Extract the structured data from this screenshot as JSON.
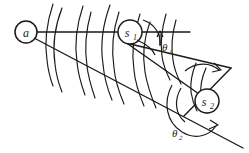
{
  "figure": {
    "type": "hand-drawn-scientific-diagram",
    "background_color": "#ffffff",
    "ink_color": "#1a1a1a",
    "width": 249,
    "height": 153
  },
  "nodes": [
    {
      "id": "a",
      "label": "a",
      "cx": 26,
      "cy": 32,
      "r": 11
    },
    {
      "id": "s1",
      "label": "s",
      "sub": "1",
      "cx": 130,
      "cy": 32,
      "r": 12
    },
    {
      "id": "s2",
      "label": "s",
      "sub": "2",
      "cx": 207,
      "cy": 101,
      "r": 12
    }
  ],
  "angles": [
    {
      "id": "theta1",
      "label": "θ",
      "sub": "1",
      "x": 161,
      "y": 47,
      "at_node": "s1"
    },
    {
      "id": "theta2",
      "label": "θ",
      "sub": "2",
      "x": 175,
      "y": 133,
      "at_node": "s2"
    }
  ],
  "rays": [
    {
      "id": "ray-a-s1",
      "from": "a",
      "to": "s1",
      "note": "horizontal reference ray"
    },
    {
      "id": "ray-a-s2",
      "from": "a",
      "to": "s2",
      "note": "oblique scattering ray"
    },
    {
      "id": "ray-s1-s2",
      "from": "s1",
      "to": "s2",
      "note": "secondary scattering ray"
    }
  ],
  "wavefronts": {
    "count": 8,
    "note": "curved arcs crossing both rays, representing successive wavefronts"
  }
}
